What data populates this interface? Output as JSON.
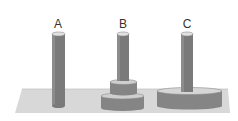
{
  "diagram": {
    "type": "tower-of-hanoi",
    "pegs": [
      {
        "label": "A",
        "discs": []
      },
      {
        "label": "B",
        "discs": [
          "medium",
          "small"
        ]
      },
      {
        "label": "C",
        "discs": [
          "large"
        ]
      }
    ]
  },
  "colors": {
    "background": "#ffffff",
    "base": "#d6d6d6",
    "peg": "#7a7a7a",
    "peg_top": "#e2e2e2",
    "disc_side": "#858585",
    "disc_top": "#cfcfcf",
    "label": "#333333"
  }
}
